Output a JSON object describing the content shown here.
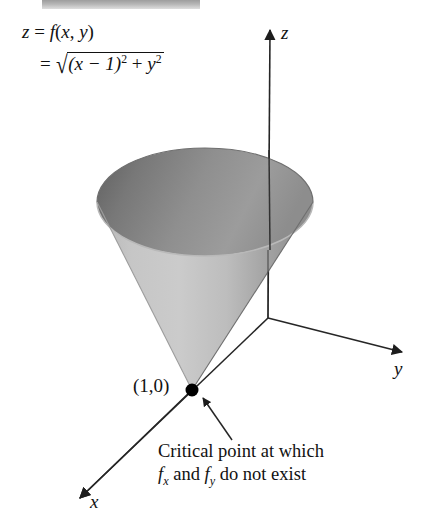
{
  "figure": {
    "background_color": "#ffffff",
    "width": 441,
    "height": 520,
    "header_band": {
      "present": true,
      "color": "#9a9a9a",
      "note": "cropped page header strip at top edge"
    }
  },
  "formula": {
    "line1": "z = f(x, y)",
    "line2_prefix": "=",
    "radical_open": "√",
    "radicand_part1": "(x − 1)",
    "radicand_exp1": "2",
    "radicand_plus": "+",
    "radicand_part2": "y",
    "radicand_exp2": "2",
    "full_text": "z = f(x, y) = √((x − 1)² + y²)"
  },
  "axes": {
    "z_label": "z",
    "y_label": "y",
    "x_label": "x",
    "origin": [
      268,
      318
    ],
    "line_color": "#262626"
  },
  "surface": {
    "name": "cone",
    "apex": [
      192,
      390
    ],
    "rim_center": [
      205,
      202
    ],
    "rim_rx": 108,
    "rim_ry": 54,
    "outer_light": "#c9c9c9",
    "outer_mid": "#b4b4b4",
    "outer_dark": "#8b8b8b",
    "inner_dark": "#6c6c6c",
    "inner_light": "#9e9e9e",
    "edge_color": "#7a7a7a"
  },
  "critical_point": {
    "label": "(1,0)",
    "marker": "filled-dot",
    "marker_color": "#000000",
    "position": [
      192,
      390
    ]
  },
  "caption": {
    "line1": "Critical point at which",
    "line2_prefix": "f",
    "line2_sub1": "x",
    "line2_mid": " and ",
    "line2_f2": "f",
    "line2_sub2": "y",
    "line2_suffix": " do not exist",
    "full_text": "Critical point at which f_x and f_y do not exist"
  }
}
